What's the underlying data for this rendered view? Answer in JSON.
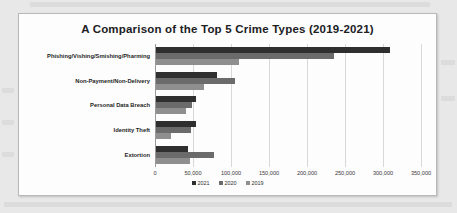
{
  "card": {
    "title": "A Comparison of the Top 5 Crime Types (2019-2021)"
  },
  "legend": {
    "items": [
      {
        "label": "2021",
        "color": "#2f2f2f"
      },
      {
        "label": "2020",
        "color": "#6b6b6b"
      },
      {
        "label": "2019",
        "color": "#8f8f8f"
      }
    ]
  },
  "axis": {
    "tick_labels": [
      "0",
      "50,000",
      "100,000",
      "150,000",
      "200,000",
      "250,000",
      "300,000",
      "350,000"
    ]
  },
  "chart_data": {
    "type": "bar",
    "orientation": "horizontal",
    "title": "A Comparison of the Top 5 Crime Types (2019-2021)",
    "xlabel": "",
    "ylabel": "",
    "xlim": [
      0,
      350000
    ],
    "grid": true,
    "legend_position": "bottom",
    "categories": [
      "Phishing/Vishing/Smishing/Pharming",
      "Non-Payment/Non-Delivery",
      "Personal Data Breach",
      "Identity Theft",
      "Extortion"
    ],
    "series": [
      {
        "name": "2021",
        "color": "#2f2f2f",
        "values": [
          307500,
          80000,
          52500,
          52500,
          42500
        ]
      },
      {
        "name": "2020",
        "color": "#6b6b6b",
        "values": [
          233750,
          103750,
          47500,
          46250,
          76250
        ]
      },
      {
        "name": "2019",
        "color": "#8f8f8f",
        "values": [
          108750,
          63750,
          40000,
          20000,
          45000
        ]
      }
    ]
  }
}
